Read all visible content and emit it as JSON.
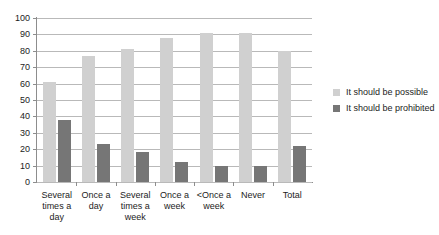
{
  "chart_data": {
    "type": "bar",
    "title": "",
    "subtitle": "",
    "xlabel": "",
    "ylabel": "",
    "ylim": [
      0,
      100
    ],
    "ytick_step": 10,
    "yticks": [
      0,
      10,
      20,
      30,
      40,
      50,
      60,
      70,
      80,
      90,
      100
    ],
    "grid": "horizontal",
    "legend_position": "right",
    "categories": [
      "Several times a day",
      "Once a day",
      "Several times a week",
      "Once a week",
      "<Once a week",
      "Never",
      "Total"
    ],
    "category_lines": [
      [
        "Several",
        "times a",
        "day"
      ],
      [
        "Once a",
        "day"
      ],
      [
        "Several",
        "times a",
        "week"
      ],
      [
        "Once a",
        "week"
      ],
      [
        "<Once a",
        "week"
      ],
      [
        "Never"
      ],
      [
        "Total"
      ]
    ],
    "series": [
      {
        "name": "It should be possible",
        "color": "#d0d0d0",
        "values": [
          61,
          77,
          81,
          88,
          91,
          91,
          80
        ]
      },
      {
        "name": "It should be prohibited",
        "color": "#767676",
        "values": [
          38,
          23,
          18,
          12,
          10,
          10,
          22
        ]
      }
    ]
  },
  "colors": {
    "possible": "#d0d0d0",
    "prohibited": "#767676",
    "axis": "#8d8d8d",
    "grid": "#b9b9b9",
    "text": "#1c1c1c",
    "background": "#ffffff"
  }
}
